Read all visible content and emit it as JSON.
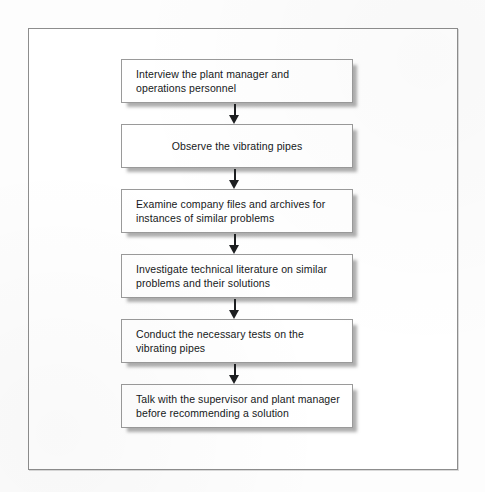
{
  "figure": {
    "type": "flowchart",
    "orientation": "vertical",
    "connector_icon": "down-arrow-icon",
    "frame_color": "#8d8d8d",
    "box_fill_color": "#ffffff",
    "box_border_color": "#9a9a9a",
    "shadow_color": "#6e6e6e",
    "text_color": "#16181a",
    "steps": [
      {
        "index": 1,
        "text": "Interview the plant manager and\noperations personnel",
        "align": "left"
      },
      {
        "index": 2,
        "text": "Observe the vibrating pipes",
        "align": "center"
      },
      {
        "index": 3,
        "text": "Examine company files and archives for\ninstances of similar problems",
        "align": "left"
      },
      {
        "index": 4,
        "text": "Investigate technical literature on similar\nproblems and their solutions",
        "align": "left"
      },
      {
        "index": 5,
        "text": "Conduct the necessary tests on the\nvibrating pipes",
        "align": "left"
      },
      {
        "index": 6,
        "text": "Talk with the supervisor and plant manager\nbefore recommending a solution",
        "align": "left"
      }
    ]
  }
}
